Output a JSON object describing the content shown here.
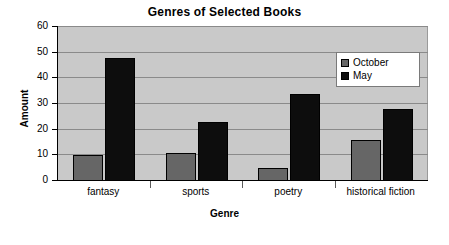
{
  "chart_data": {
    "type": "bar",
    "title": "Genres of Selected Books",
    "xlabel": "Genre",
    "ylabel": "Amount",
    "categories": [
      "fantasy",
      "sports",
      "poetry",
      "historical fiction"
    ],
    "series": [
      {
        "name": "October",
        "color": "#666666",
        "values": [
          10,
          11,
          5,
          16
        ]
      },
      {
        "name": "May",
        "color": "#0d0d0d",
        "values": [
          48,
          23,
          34,
          28
        ]
      }
    ],
    "ylim": [
      0,
      60
    ],
    "yticks": [
      0,
      10,
      20,
      30,
      40,
      50,
      60
    ],
    "ytick_labels": [
      "0",
      "10",
      "20",
      "30",
      "40",
      "50",
      "60"
    ],
    "grid": true,
    "grid_axis": "y",
    "legend_position": "upper right inside",
    "plot_background": "#c9c9c9",
    "page_background": "#ffffff",
    "grid_color": "#8a8a8a",
    "axis_color": "#000000"
  }
}
